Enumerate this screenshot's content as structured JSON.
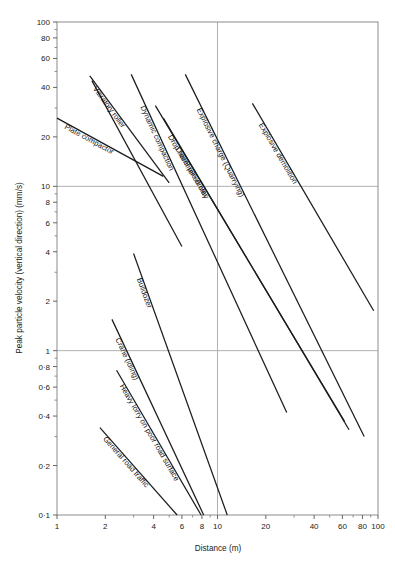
{
  "chart_data": {
    "type": "line",
    "title": "",
    "xlabel": "Distance (m)",
    "ylabel": "Peak particle velocity (vertical direction) (mm/s)",
    "xscale": "log",
    "yscale": "log",
    "xlim": [
      1,
      100
    ],
    "ylim": [
      0.1,
      100
    ],
    "grid": "major gridlines at x=10, y=1, y=10",
    "legend": "none (inline rotated labels along each line)",
    "xticks": [
      "1",
      "2",
      "4",
      "6",
      "8",
      "10",
      "20",
      "40",
      "60",
      "80",
      "100"
    ],
    "xtick_values": [
      1,
      2,
      4,
      6,
      8,
      10,
      20,
      40,
      60,
      80,
      100
    ],
    "yticks": [
      "100",
      "80",
      "60",
      "40",
      "20",
      "10",
      "8",
      "6",
      "4",
      "2",
      "1",
      "0·8",
      "0·6",
      "0·4",
      "0·2",
      "0·1"
    ],
    "ytick_values": [
      100,
      80,
      60,
      40,
      20,
      10,
      8,
      6,
      4,
      2,
      1,
      0.8,
      0.6,
      0.4,
      0.2,
      0.1
    ],
    "series": [
      {
        "name": "Plate compactor",
        "label": "Plate compactor",
        "points": [
          [
            1.0,
            26.0
          ],
          [
            4.6,
            11.5
          ]
        ]
      },
      {
        "name": "Vibratory roller (upper)",
        "label": "Vibratory roller",
        "points": [
          [
            1.6,
            47.0
          ],
          [
            5.0,
            10.5
          ]
        ]
      },
      {
        "name": "Vibratory roller (lower)",
        "label": "",
        "points": [
          [
            1.65,
            44.0
          ],
          [
            6.0,
            4.3
          ]
        ]
      },
      {
        "name": "Dynamic compaction",
        "label": "Dynamic compaction",
        "points": [
          [
            2.9,
            48.0
          ],
          [
            27.0,
            0.42
          ]
        ]
      },
      {
        "name": "Explosive charge (Quarrying)",
        "label": "Explosive charge (Quarrying)",
        "points": [
          [
            6.3,
            48.0
          ],
          [
            82.0,
            0.3
          ]
        ]
      },
      {
        "name": "Drop hammer on clay",
        "label": "Drop hammer on clay",
        "points": [
          [
            4.1,
            31.0
          ],
          [
            62.0,
            0.37
          ]
        ]
      },
      {
        "name": "Diesel pile-driver",
        "label": "Diesel pile-driver",
        "points": [
          [
            4.6,
            26.0
          ],
          [
            66.0,
            0.33
          ]
        ]
      },
      {
        "name": "Explosive demolition",
        "label": "Explosive demolition",
        "points": [
          [
            16.5,
            32.0
          ],
          [
            94.0,
            1.75
          ]
        ]
      },
      {
        "name": "Crane (idling)",
        "label": "Crane (idling)",
        "points": [
          [
            2.2,
            1.55
          ],
          [
            8.2,
            0.1
          ]
        ]
      },
      {
        "name": "Bulldozer",
        "label": "Bulldozer",
        "points": [
          [
            3.0,
            3.9
          ],
          [
            11.5,
            0.1
          ]
        ]
      },
      {
        "name": "Heavy lorry on poor road surface",
        "label": "Heavy lorry on poor road surface",
        "points": [
          [
            2.35,
            0.76
          ],
          [
            7.9,
            0.1
          ]
        ]
      },
      {
        "name": "General road traffic",
        "label": "General road traffic",
        "points": [
          [
            1.85,
            0.34
          ],
          [
            5.6,
            0.1
          ]
        ]
      }
    ],
    "colors": {
      "line": "#1c1c1c",
      "grid": "#b0b0b0",
      "frame": "#8c8c8c",
      "text": "#1a1a1a",
      "background": "#ffffff"
    }
  }
}
